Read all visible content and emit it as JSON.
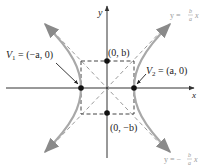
{
  "diagram": {
    "axes": {
      "x_label": "x",
      "y_label": "y"
    },
    "vertices": [
      {
        "name": "V1",
        "label_main": "V",
        "label_sub": "1",
        "label_value": " = (−a, 0)"
      },
      {
        "name": "V2",
        "label_main": "V",
        "label_sub": "2",
        "label_value": " = (a, 0)"
      }
    ],
    "points": [
      {
        "name": "co-vertex-top",
        "label": "(0, b)"
      },
      {
        "name": "co-vertex-bottom",
        "label": "(0, −b)"
      }
    ],
    "asymptotes": [
      {
        "name": "positive",
        "label_prefix": "y = ",
        "num": "b",
        "den": "a",
        "suffix": "x"
      },
      {
        "name": "negative",
        "label_prefix": "y = −",
        "num": "b",
        "den": "a",
        "suffix": "x"
      }
    ],
    "colors": {
      "axis": "#333333",
      "curve": "#a8a8a8",
      "asymptote": "#9a9a9a",
      "box": "#444444",
      "point": "#111111",
      "pointer": "#222222"
    }
  }
}
